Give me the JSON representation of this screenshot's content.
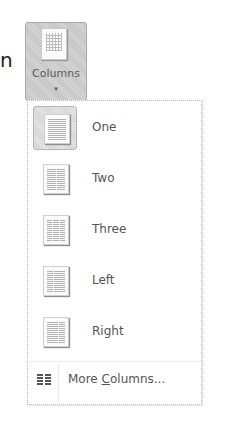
{
  "partial_text": "n",
  "ribbon_button": {
    "label": "Columns",
    "caret": "▾",
    "icon": "columns-icon"
  },
  "menu": {
    "items": [
      {
        "label": "One",
        "icon": "one-column-icon",
        "columns": 1,
        "selected": true
      },
      {
        "label": "Two",
        "icon": "two-columns-icon",
        "columns": 2,
        "selected": false
      },
      {
        "label": "Three",
        "icon": "three-columns-icon",
        "columns": 3,
        "selected": false
      },
      {
        "label": "Left",
        "icon": "left-column-icon",
        "columns": 2,
        "selected": false
      },
      {
        "label": "Right",
        "icon": "right-column-icon",
        "columns": 2,
        "selected": false
      }
    ],
    "more": {
      "label_prefix": "More ",
      "access_key": "C",
      "label_suffix": "olumns...",
      "icon": "more-columns-icon"
    }
  }
}
